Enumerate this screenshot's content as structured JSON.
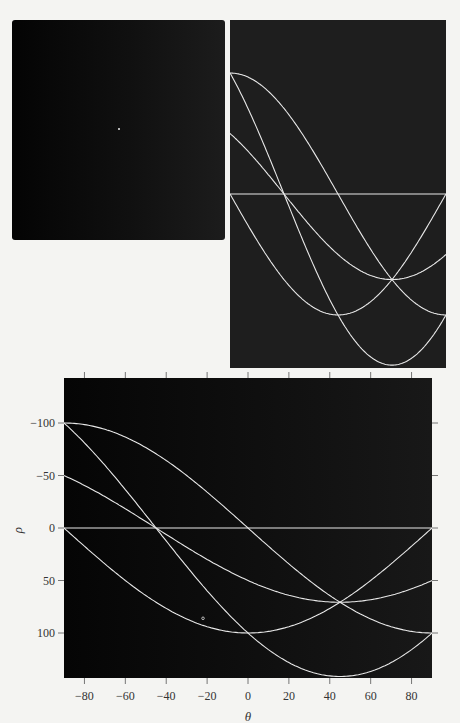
{
  "figure": {
    "input_image": {
      "description": "Binary image with five isolated white points",
      "visible_points_px": [
        [
          119,
          128
        ]
      ]
    },
    "small_panel": {
      "description": "Hough transform (uncropped, no axes)"
    }
  },
  "chart_data": {
    "type": "line",
    "title": "",
    "xlabel": "θ",
    "ylabel": "ρ",
    "xlim": [
      -90,
      90
    ],
    "ylim": [
      143,
      -143
    ],
    "y_inverted": true,
    "xticks": [
      -80,
      -60,
      -40,
      -20,
      0,
      20,
      40,
      60,
      80
    ],
    "yticks": [
      -100,
      -50,
      0,
      50,
      100
    ],
    "ytick_labels": [
      "−100",
      "−50",
      "0",
      "50",
      "100"
    ],
    "xtick_labels": [
      "−80",
      "−60",
      "−40",
      "−20",
      "0",
      "20",
      "40",
      "60",
      "80"
    ],
    "grid": false,
    "background": "#0a0a0a",
    "curve_color": "#e8e8e8",
    "formula": "rho = x*cos(theta) + y*sin(theta)",
    "series": [
      {
        "name": "point (0,0)",
        "x": 0,
        "y": 0
      },
      {
        "name": "point (100,0)",
        "x": 100,
        "y": 0
      },
      {
        "name": "point (50,50)",
        "x": 50,
        "y": 50
      },
      {
        "name": "point (0,100)",
        "x": 0,
        "y": 100
      },
      {
        "name": "point (100,100)",
        "x": 100,
        "y": 100
      }
    ],
    "intersections": [
      {
        "theta": -45,
        "rho": 0
      },
      {
        "theta": 45,
        "rho": 70.7
      }
    ],
    "annotations": [
      {
        "theta": -22,
        "rho": 86,
        "mark": "small circle"
      }
    ]
  }
}
